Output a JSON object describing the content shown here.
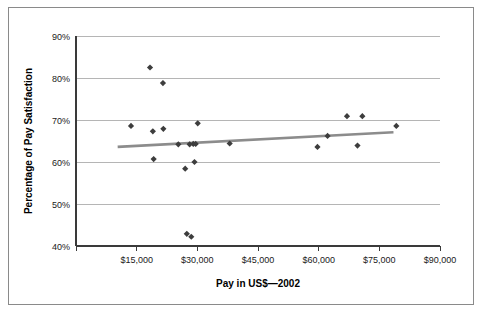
{
  "chart_data": {
    "type": "scatter",
    "title": "",
    "xlabel": "Pay in US$—2002",
    "ylabel": "Percentage of Pay Satisfaction",
    "xlim": [
      0,
      90000
    ],
    "ylim": [
      40,
      90
    ],
    "xticks": [
      0,
      15000,
      30000,
      45000,
      60000,
      75000,
      90000
    ],
    "xtick_labels": [
      "",
      "$15,000",
      "$30,000",
      "$45,000",
      "$60,000",
      "$75,000",
      "$90,000"
    ],
    "yticks": [
      40,
      50,
      60,
      70,
      80,
      90
    ],
    "ytick_labels": [
      "40%",
      "50%",
      "60%",
      "70%",
      "80%",
      "90%"
    ],
    "grid": "horizontal",
    "legend": "none",
    "marker_shape": "diamond",
    "marker_color": "#3d3d3d",
    "trendline_color": "#8c8c8c",
    "points": [
      {
        "x": 13600,
        "y": 68.6
      },
      {
        "x": 18300,
        "y": 82.5
      },
      {
        "x": 19000,
        "y": 67.3
      },
      {
        "x": 19200,
        "y": 60.7
      },
      {
        "x": 21500,
        "y": 78.8
      },
      {
        "x": 21600,
        "y": 67.9
      },
      {
        "x": 25300,
        "y": 64.2
      },
      {
        "x": 27000,
        "y": 58.4
      },
      {
        "x": 27400,
        "y": 42.9
      },
      {
        "x": 28100,
        "y": 64.2
      },
      {
        "x": 28500,
        "y": 42.2
      },
      {
        "x": 29000,
        "y": 64.3
      },
      {
        "x": 29300,
        "y": 60.0
      },
      {
        "x": 29600,
        "y": 64.3
      },
      {
        "x": 30100,
        "y": 69.2
      },
      {
        "x": 38000,
        "y": 64.4
      },
      {
        "x": 59700,
        "y": 63.6
      },
      {
        "x": 62200,
        "y": 66.2
      },
      {
        "x": 67000,
        "y": 70.9
      },
      {
        "x": 69600,
        "y": 63.9
      },
      {
        "x": 70800,
        "y": 70.9
      },
      {
        "x": 79200,
        "y": 68.6
      }
    ],
    "trendline": {
      "x_start": 10300,
      "y_start": 63.6,
      "x_end": 78500,
      "y_end": 67.1
    }
  },
  "figure": {
    "border_color": "#8a8a8a",
    "background_color": "#ffffff",
    "axis_color": "#3a3a3a",
    "gridline_color": "#b5b5b5"
  }
}
